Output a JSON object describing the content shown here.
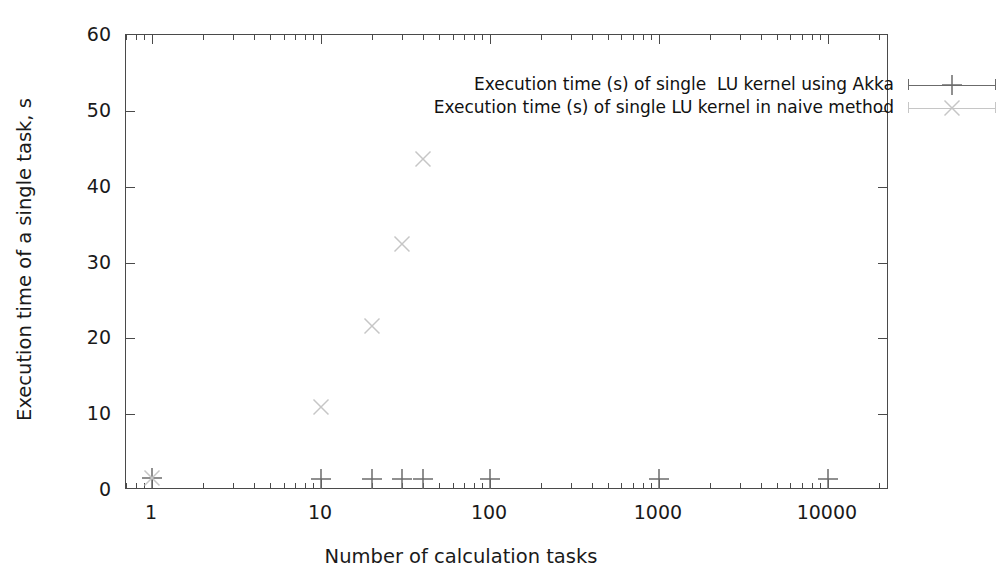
{
  "chart_data": {
    "type": "scatter",
    "title": "",
    "xlabel": "Number of calculation tasks",
    "ylabel": "Execution time of a single task, s",
    "xscale": "log",
    "yscale": "linear",
    "xlim": [
      0.7,
      23000
    ],
    "ylim": [
      0,
      60
    ],
    "ytick_labels": [
      "0",
      "10",
      "20",
      "30",
      "40",
      "50",
      "60"
    ],
    "ytick_values": [
      0,
      10,
      20,
      30,
      40,
      50,
      60
    ],
    "xtick_labels": [
      "1",
      "10",
      "100",
      "1000",
      "10000"
    ],
    "xtick_values": [
      1,
      10,
      100,
      1000,
      10000
    ],
    "grid": false,
    "legend_position": "top-right-inside",
    "series": [
      {
        "name": "Execution time (s) of single  LU kernel using Akka",
        "marker": "plus",
        "color": "#6b6b6b",
        "points": [
          {
            "x": 1,
            "y": 1.6
          },
          {
            "x": 10,
            "y": 1.5
          },
          {
            "x": 20,
            "y": 1.5
          },
          {
            "x": 30,
            "y": 1.5
          },
          {
            "x": 40,
            "y": 1.5
          },
          {
            "x": 100,
            "y": 1.5
          },
          {
            "x": 1000,
            "y": 1.5
          },
          {
            "x": 10000,
            "y": 1.5
          }
        ]
      },
      {
        "name": "Execution time (s) of single LU kernel in naive method",
        "marker": "cross",
        "color": "#c6c6c6",
        "points": [
          {
            "x": 1,
            "y": 1.6
          },
          {
            "x": 10,
            "y": 10.9
          },
          {
            "x": 20,
            "y": 21.6
          },
          {
            "x": 30,
            "y": 32.4
          },
          {
            "x": 40,
            "y": 43.7
          }
        ]
      }
    ]
  },
  "axes": {
    "x_title": "Number of calculation tasks",
    "y_title": "Execution time of a single task, s"
  },
  "legend": {
    "entries": [
      {
        "label": "Execution time (s) of single  LU kernel using Akka",
        "marker": "plus",
        "color": "#6b6b6b"
      },
      {
        "label": "Execution time (s) of single LU kernel in naive method",
        "marker": "cross",
        "color": "#c6c6c6"
      }
    ]
  },
  "style": {
    "frame_color": "#4a4a4a",
    "text_color": "#1a1a1a",
    "background": "#ffffff"
  }
}
